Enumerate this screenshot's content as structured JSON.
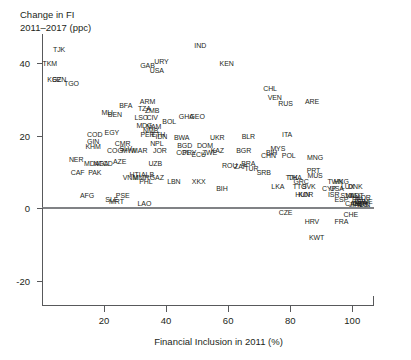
{
  "chart_data": {
    "type": "scatter",
    "title": "",
    "ylabel": "Change in FI 2011–2017 (ppc)",
    "ylabel_line1": "Change in FI",
    "ylabel_line2": "2011–2017 (ppc)",
    "xlabel": "Financial Inclusion in 2011 (%)",
    "xlim": [
      0,
      107
    ],
    "ylim": [
      -27,
      48
    ],
    "xticks": [
      20,
      40,
      60,
      80,
      100
    ],
    "yticks": [
      40,
      20,
      0,
      -20
    ],
    "xtick_labels": [
      "20",
      "40",
      "60",
      "80",
      "100"
    ],
    "ytick_labels": [
      "40",
      "20",
      "0",
      "-20"
    ],
    "grid": false,
    "legend": "none",
    "marker_style": "text-label-iso3",
    "reference_lines": [
      {
        "axis": "y",
        "value": 0,
        "color": "#808285"
      }
    ],
    "axis_color": "#58595b",
    "text_color": "#231f20",
    "note": "Each point is labelled with a country ISO-3 code; x = Financial Inclusion in 2011 (%), y = change in financial inclusion 2011-2017 in percentage points.",
    "points": [
      {
        "label": "TJK",
        "x": 5.5,
        "y": 44.0
      },
      {
        "label": "TKM",
        "x": 2.5,
        "y": 40.0
      },
      {
        "label": "KGZ",
        "x": 4.0,
        "y": 35.5
      },
      {
        "label": "SEN",
        "x": 5.5,
        "y": 35.5
      },
      {
        "label": "TGO",
        "x": 9.5,
        "y": 34.5
      },
      {
        "label": "GAB",
        "x": 34.0,
        "y": 39.5
      },
      {
        "label": "URY",
        "x": 38.5,
        "y": 40.5
      },
      {
        "label": "USA",
        "x": 37.0,
        "y": 38.0
      },
      {
        "label": "IND",
        "x": 51.0,
        "y": 45.0
      },
      {
        "label": "KEN",
        "x": 59.5,
        "y": 40.0
      },
      {
        "label": "CHL",
        "x": 73.5,
        "y": 33.0
      },
      {
        "label": "VEN",
        "x": 75.0,
        "y": 30.5
      },
      {
        "label": "RUS",
        "x": 78.5,
        "y": 29.0
      },
      {
        "label": "ARE",
        "x": 87.0,
        "y": 29.5
      },
      {
        "label": "BFA",
        "x": 27.0,
        "y": 28.5
      },
      {
        "label": "ARM",
        "x": 34.0,
        "y": 29.5
      },
      {
        "label": "TZA",
        "x": 33.0,
        "y": 27.5
      },
      {
        "label": "ZMB",
        "x": 35.5,
        "y": 27.0
      },
      {
        "label": "BEN",
        "x": 23.5,
        "y": 26.0
      },
      {
        "label": "MLI",
        "x": 21.0,
        "y": 26.5
      },
      {
        "label": "LSO",
        "x": 32.0,
        "y": 25.0
      },
      {
        "label": "CIV",
        "x": 35.5,
        "y": 25.0
      },
      {
        "label": "BOL",
        "x": 41.0,
        "y": 24.0
      },
      {
        "label": "GHA",
        "x": 46.5,
        "y": 25.5
      },
      {
        "label": "GEO",
        "x": 50.0,
        "y": 25.5
      },
      {
        "label": "MDG",
        "x": 33.0,
        "y": 23.0
      },
      {
        "label": "NAM",
        "x": 36.0,
        "y": 22.5
      },
      {
        "label": "NMB",
        "x": 35.0,
        "y": 21.5
      },
      {
        "label": "COD",
        "x": 17.0,
        "y": 20.5
      },
      {
        "label": "EGY",
        "x": 22.5,
        "y": 21.0
      },
      {
        "label": "PER",
        "x": 34.0,
        "y": 20.5
      },
      {
        "label": "ETH",
        "x": 37.5,
        "y": 20.5
      },
      {
        "label": "IDN",
        "x": 38.5,
        "y": 20.0
      },
      {
        "label": "BWA",
        "x": 45.0,
        "y": 19.5
      },
      {
        "label": "UKR",
        "x": 56.5,
        "y": 19.5
      },
      {
        "label": "GIN",
        "x": 16.5,
        "y": 18.5
      },
      {
        "label": "CMR",
        "x": 26.0,
        "y": 18.0
      },
      {
        "label": "NPL",
        "x": 37.0,
        "y": 18.0
      },
      {
        "label": "BGD",
        "x": 46.0,
        "y": 17.5
      },
      {
        "label": "DOM",
        "x": 52.5,
        "y": 17.5
      },
      {
        "label": "BLR",
        "x": 66.5,
        "y": 20.0
      },
      {
        "label": "ITA",
        "x": 79.0,
        "y": 20.5
      },
      {
        "label": "KHM",
        "x": 16.5,
        "y": 17.0
      },
      {
        "label": "COG",
        "x": 23.5,
        "y": 16.0
      },
      {
        "label": "MWI",
        "x": 28.0,
        "y": 16.0
      },
      {
        "label": "SLV",
        "x": 27.0,
        "y": 16.5
      },
      {
        "label": "MAR",
        "x": 31.5,
        "y": 16.0
      },
      {
        "label": "JOR",
        "x": 38.0,
        "y": 16.0
      },
      {
        "label": "COL",
        "x": 45.5,
        "y": 15.5
      },
      {
        "label": "PRY",
        "x": 47.5,
        "y": 15.5
      },
      {
        "label": "ECU",
        "x": 50.5,
        "y": 15.0
      },
      {
        "label": "ZWE",
        "x": 54.0,
        "y": 15.5
      },
      {
        "label": "KAZ",
        "x": 56.5,
        "y": 16.0
      },
      {
        "label": "BGR",
        "x": 65.0,
        "y": 16.0
      },
      {
        "label": "MYS",
        "x": 76.0,
        "y": 16.5
      },
      {
        "label": "BIH",
        "x": 74.0,
        "y": 15.5
      },
      {
        "label": "CHN",
        "x": 73.0,
        "y": 14.5
      },
      {
        "label": "POL",
        "x": 79.5,
        "y": 14.5
      },
      {
        "label": "MNG",
        "x": 88.0,
        "y": 14.0
      },
      {
        "label": "NER",
        "x": 11.0,
        "y": 13.5
      },
      {
        "label": "MDA",
        "x": 16.0,
        "y": 12.5
      },
      {
        "label": "NGA",
        "x": 19.0,
        "y": 12.5
      },
      {
        "label": "TCD",
        "x": 20.5,
        "y": 12.5
      },
      {
        "label": "AZE",
        "x": 25.0,
        "y": 13.0
      },
      {
        "label": "UZB",
        "x": 36.5,
        "y": 12.5
      },
      {
        "label": "ROU",
        "x": 60.5,
        "y": 12.0
      },
      {
        "label": "ZAF",
        "x": 64.0,
        "y": 11.5
      },
      {
        "label": "BRA",
        "x": 66.5,
        "y": 12.5
      },
      {
        "label": "TUR",
        "x": 67.5,
        "y": 11.0
      },
      {
        "label": "SRB",
        "x": 71.5,
        "y": 10.0
      },
      {
        "label": "PRT",
        "x": 87.5,
        "y": 10.5
      },
      {
        "label": "MUS",
        "x": 88.0,
        "y": 9.0
      },
      {
        "label": "CAF",
        "x": 11.5,
        "y": 10.0
      },
      {
        "label": "PAK",
        "x": 17.0,
        "y": 10.0
      },
      {
        "label": "HTI",
        "x": 30.0,
        "y": 9.5
      },
      {
        "label": "VNM",
        "x": 28.5,
        "y": 8.5
      },
      {
        "label": "MMR",
        "x": 32.0,
        "y": 8.5
      },
      {
        "label": "ALB",
        "x": 34.0,
        "y": 9.5
      },
      {
        "label": "GAZ",
        "x": 37.0,
        "y": 8.5
      },
      {
        "label": "PHL",
        "x": 33.5,
        "y": 7.5
      },
      {
        "label": "LBN",
        "x": 42.5,
        "y": 7.5
      },
      {
        "label": "XKX",
        "x": 50.5,
        "y": 7.5
      },
      {
        "label": "BIH",
        "x": 58.0,
        "y": 5.5
      },
      {
        "label": "LKA",
        "x": 76.0,
        "y": 6.0
      },
      {
        "label": "THA",
        "x": 81.5,
        "y": 8.5
      },
      {
        "label": "TJK",
        "x": 80.5,
        "y": 8.5
      },
      {
        "label": "GRC",
        "x": 83.5,
        "y": 7.5
      },
      {
        "label": "TTO",
        "x": 83.0,
        "y": 6.0
      },
      {
        "label": "SVK",
        "x": 86.0,
        "y": 6.0
      },
      {
        "label": "HUN",
        "x": 84.0,
        "y": 4.0
      },
      {
        "label": "KOR",
        "x": 85.0,
        "y": 4.0
      },
      {
        "label": "TWN",
        "x": 94.5,
        "y": 7.5
      },
      {
        "label": "HKG",
        "x": 96.5,
        "y": 7.5
      },
      {
        "label": "CYP",
        "x": 92.5,
        "y": 5.5
      },
      {
        "label": "USA",
        "x": 95.0,
        "y": 5.5
      },
      {
        "label": "LUX",
        "x": 98.5,
        "y": 6.0
      },
      {
        "label": "DNK",
        "x": 101.0,
        "y": 6.0
      },
      {
        "label": "ISR",
        "x": 94.0,
        "y": 4.0
      },
      {
        "label": "ESP",
        "x": 96.5,
        "y": 2.5
      },
      {
        "label": "SVN",
        "x": 98.5,
        "y": 3.5
      },
      {
        "label": "NLD",
        "x": 100.0,
        "y": 3.5
      },
      {
        "label": "AUT",
        "x": 101.5,
        "y": 3.5
      },
      {
        "label": "BEL",
        "x": 102.0,
        "y": 2.5
      },
      {
        "label": "CAN",
        "x": 100.0,
        "y": 1.5
      },
      {
        "label": "GBR",
        "x": 102.5,
        "y": 1.5
      },
      {
        "label": "DEU",
        "x": 103.0,
        "y": 2.0
      },
      {
        "label": "NOR",
        "x": 103.5,
        "y": 3.0
      },
      {
        "label": "SWE",
        "x": 104.0,
        "y": 2.0
      },
      {
        "label": "FIN",
        "x": 104.0,
        "y": 1.0
      },
      {
        "label": "AUS",
        "x": 103.0,
        "y": 1.0
      },
      {
        "label": "JPN",
        "x": 101.0,
        "y": 1.0
      },
      {
        "label": "CZE",
        "x": 78.5,
        "y": -1.0
      },
      {
        "label": "HRV",
        "x": 87.0,
        "y": -3.5
      },
      {
        "label": "FRA",
        "x": 96.5,
        "y": -3.5
      },
      {
        "label": "CHE",
        "x": 99.5,
        "y": -1.5
      },
      {
        "label": "KWT",
        "x": 88.5,
        "y": -8.0
      },
      {
        "label": "AFG",
        "x": 14.5,
        "y": 3.5
      },
      {
        "label": "SLE",
        "x": 22.5,
        "y": 2.5
      },
      {
        "label": "PSE",
        "x": 26.0,
        "y": 3.5
      },
      {
        "label": "MRT",
        "x": 24.0,
        "y": 2.0
      },
      {
        "label": "LAO",
        "x": 33.0,
        "y": 1.5
      }
    ]
  }
}
